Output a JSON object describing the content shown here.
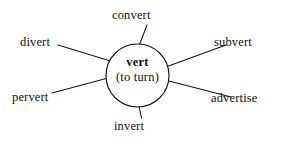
{
  "diagram": {
    "type": "word-web",
    "center": {
      "root": "vert",
      "gloss": "(to turn)"
    },
    "nodes": [
      {
        "id": "convert",
        "label": "convert",
        "position": "top"
      },
      {
        "id": "divert",
        "label": "divert",
        "position": "upper-left"
      },
      {
        "id": "subvert",
        "label": "subvert",
        "position": "upper-right"
      },
      {
        "id": "pervert",
        "label": "pervert",
        "position": "lower-left"
      },
      {
        "id": "advertise",
        "label": "advertise",
        "position": "lower-right"
      },
      {
        "id": "invert",
        "label": "invert",
        "position": "bottom"
      }
    ],
    "colors": {
      "background": "#ffffff",
      "stroke": "#141414",
      "text": "#111111"
    }
  }
}
